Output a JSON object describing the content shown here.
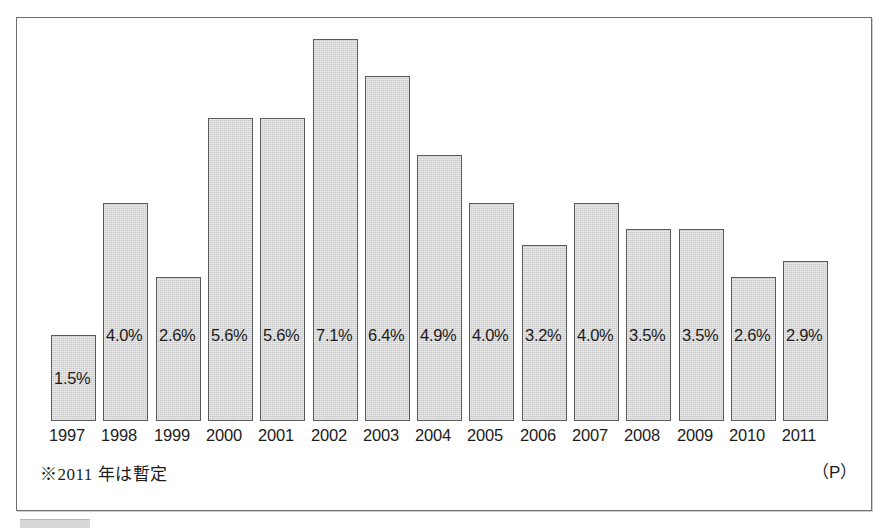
{
  "chart_data": {
    "type": "bar",
    "title": "",
    "subtitle": "",
    "xlabel": "",
    "ylabel": "",
    "categories": [
      "1997",
      "1998",
      "1999",
      "2000",
      "2001",
      "2002",
      "2003",
      "2004",
      "2005",
      "2006",
      "2007",
      "2008",
      "2009",
      "2010",
      "2011"
    ],
    "values": [
      1.5,
      4.0,
      2.6,
      5.6,
      5.6,
      7.1,
      6.4,
      4.9,
      4.0,
      3.2,
      4.0,
      3.5,
      3.5,
      2.6,
      2.9
    ],
    "value_labels": [
      "1.5%",
      "4.0%",
      "2.6%",
      "5.6%",
      "5.6%",
      "7.1%",
      "6.4%",
      "4.9%",
      "4.0%",
      "3.2%",
      "4.0%",
      "3.5%",
      "3.5%",
      "2.6%",
      "2.9%"
    ],
    "ylim": [
      0,
      7.6
    ],
    "grid": false,
    "legend": null,
    "annotations": {
      "footnote": "※2011 年は暫定",
      "prelim_marker": "（P）"
    },
    "bar_color": "#c9c9c9",
    "bar_border_color": "#5a5a5a",
    "label_color": "#1c1c1c"
  },
  "frame": {
    "border_color": "#6f6f6f",
    "background": "#ffffff"
  }
}
